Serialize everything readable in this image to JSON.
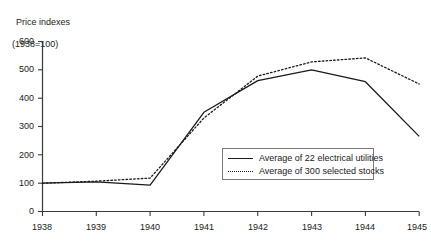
{
  "chart_data": {
    "type": "line",
    "title": "",
    "ylabel_line1": "Price indexes",
    "ylabel_line2": "(1938=100)",
    "xlabel": "",
    "ylim": [
      0,
      600
    ],
    "yticks": [
      "0",
      "100",
      "200",
      "300",
      "400",
      "500",
      "600"
    ],
    "ytick_values": [
      0,
      100,
      200,
      300,
      400,
      500,
      600
    ],
    "grid": false,
    "legend_position": "center-right-inside",
    "categories": [
      "1938",
      "1939",
      "1940",
      "1941",
      "1942",
      "1943",
      "1944",
      "1945"
    ],
    "x": [
      1938,
      1939,
      1940,
      1941,
      1942,
      1943,
      1944,
      1945
    ],
    "series": [
      {
        "name": "Average of 22 electrical utilities",
        "style": "solid",
        "color": "#1a1a1a",
        "values": [
          100,
          105,
          93,
          350,
          462,
          500,
          458,
          265
        ]
      },
      {
        "name": "Average of 300 selected stocks",
        "style": "dotted",
        "color": "#1a1a1a",
        "values": [
          100,
          107,
          118,
          330,
          478,
          528,
          542,
          450
        ]
      }
    ]
  },
  "legend": {
    "entries": [
      {
        "label": "Average of 22 electrical utilities",
        "sample": "solid-line-sample"
      },
      {
        "label": "Average of 300 selected stocks",
        "sample": "dotted-line-sample"
      }
    ]
  },
  "colors": {
    "axis": "#3a3a3a",
    "series_1": "#1a1a1a",
    "series_2": "#1a1a1a",
    "legend_border": "#7a7a7a",
    "background": "#ffffff"
  }
}
